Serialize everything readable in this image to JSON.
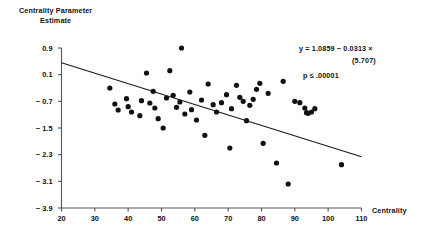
{
  "chart_data": {
    "type": "scatter",
    "title": "",
    "ylabel": "Centrality Parameter Estimate",
    "ylabel_line1": "Centrality Parameter",
    "ylabel_line2": "Estimate",
    "xlabel": "Centrality",
    "xlim": [
      20,
      110
    ],
    "ylim": [
      -3.9,
      0.9
    ],
    "xticks": [
      20,
      30,
      40,
      50,
      60,
      70,
      80,
      90,
      100,
      110
    ],
    "xtick_labels": [
      "20",
      "30",
      "40",
      "50",
      "60",
      "70",
      "80",
      "90",
      "100",
      "110"
    ],
    "yticks": [
      0.9,
      0.1,
      -0.7,
      -1.5,
      -2.3,
      -3.1,
      -3.9
    ],
    "ytick_labels": [
      "0.9",
      "0.1",
      "− 0.7",
      "− 1.5",
      "− 2.3",
      "− 3.1",
      "− 3.9"
    ],
    "grid": false,
    "legend": "none",
    "marker_color": "#111111",
    "line_color": "#1a1a1a",
    "axis_color": "#555555",
    "points": [
      [
        34.5,
        -0.3
      ],
      [
        36.0,
        -0.78
      ],
      [
        37.0,
        -0.96
      ],
      [
        39.5,
        -0.62
      ],
      [
        40.0,
        -0.86
      ],
      [
        41.0,
        -1.02
      ],
      [
        43.5,
        -1.13
      ],
      [
        44.0,
        -0.68
      ],
      [
        45.5,
        0.15
      ],
      [
        46.5,
        -0.75
      ],
      [
        47.5,
        -0.4
      ],
      [
        48.0,
        -0.9
      ],
      [
        49.0,
        -1.22
      ],
      [
        50.5,
        -1.5
      ],
      [
        51.5,
        -0.6
      ],
      [
        52.5,
        0.22
      ],
      [
        53.5,
        -0.52
      ],
      [
        54.5,
        -0.88
      ],
      [
        55.5,
        -0.72
      ],
      [
        56.0,
        0.9
      ],
      [
        57.0,
        -1.08
      ],
      [
        58.5,
        -0.42
      ],
      [
        59.0,
        -0.95
      ],
      [
        60.5,
        -1.26
      ],
      [
        62.0,
        -0.66
      ],
      [
        63.0,
        -1.72
      ],
      [
        64.0,
        -0.18
      ],
      [
        65.5,
        -0.8
      ],
      [
        66.5,
        -1.02
      ],
      [
        68.0,
        -0.74
      ],
      [
        69.5,
        -0.5
      ],
      [
        70.5,
        -2.1
      ],
      [
        71.0,
        -0.92
      ],
      [
        72.5,
        -0.22
      ],
      [
        73.5,
        -0.58
      ],
      [
        74.5,
        -0.7
      ],
      [
        75.5,
        -1.28
      ],
      [
        76.5,
        -0.82
      ],
      [
        77.5,
        -0.64
      ],
      [
        78.5,
        -0.34
      ],
      [
        79.5,
        -0.16
      ],
      [
        80.5,
        -1.96
      ],
      [
        82.0,
        -0.46
      ],
      [
        84.5,
        -2.55
      ],
      [
        86.5,
        -0.1
      ],
      [
        88.0,
        -3.18
      ],
      [
        90.0,
        -0.7
      ],
      [
        91.5,
        -0.74
      ],
      [
        93.0,
        -0.9
      ],
      [
        93.5,
        -1.04
      ],
      [
        94.0,
        -1.06
      ],
      [
        95.0,
        -1.02
      ],
      [
        96.0,
        -0.92
      ],
      [
        104.0,
        -2.6
      ]
    ],
    "regression": {
      "equation": "y = 1.0859 − 0.0313 ×",
      "t_statistic": "(5.707)",
      "p_value": "p ≤ .00001",
      "intercept": 1.0859,
      "slope": -0.0313,
      "x_start": 20,
      "x_end": 110,
      "y_start": 0.46,
      "y_end": -2.36
    }
  }
}
